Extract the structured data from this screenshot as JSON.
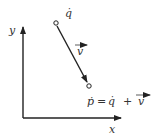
{
  "diagram": {
    "axes": {
      "x_label": "x",
      "y_label": "y"
    },
    "points": {
      "q": {
        "label": "q̇",
        "x": 56,
        "y": 23
      },
      "p": {
        "x": 89,
        "y": 86
      }
    },
    "vector": {
      "label": "v",
      "from": "q",
      "to": "p"
    },
    "equation": {
      "lhs": "ṗ",
      "eq": "=",
      "term1": "q̇",
      "plus": "+",
      "term2": "v"
    },
    "colors": {
      "stroke": "#222222",
      "text": "#333333"
    }
  }
}
